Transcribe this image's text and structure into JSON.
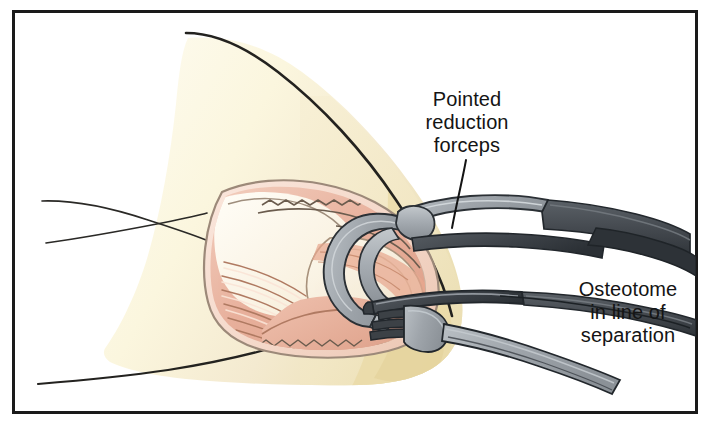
{
  "figure": {
    "type": "medical-surgical-illustration",
    "frame": {
      "border_color": "#1a1a1a",
      "border_width_px": 3,
      "background": "#ffffff",
      "inner_background": "#ffffff",
      "x": 12,
      "y": 10,
      "width": 686,
      "height": 404
    },
    "labels": [
      {
        "id": "forceps",
        "name": "pointed-reduction-forceps-label",
        "lines": [
          "Pointed",
          "reduction",
          "forceps"
        ],
        "align": "center",
        "leader": {
          "from_x": 466,
          "from_y": 162,
          "to_x": 452,
          "to_y": 228
        }
      },
      {
        "id": "osteotome",
        "name": "osteotome-label",
        "lines": [
          "Osteotome",
          "in line of",
          "separation"
        ],
        "align": "center",
        "leader": null
      }
    ],
    "colors": {
      "skin_light": "#fdfaec",
      "skin_mid": "#f7efcf",
      "skin_deep": "#efe3b0",
      "skin_shadow": "#e8d9a4",
      "dermis_pink": "#f6dcd0",
      "dermis_edge": "#a89585",
      "muscle_light": "#f0c8b6",
      "muscle_mid": "#e5ab97",
      "muscle_deep": "#d79682",
      "bone_cream": "#faf2e2",
      "bone_shade": "#efe2c8",
      "metal_light": "#aab0b6",
      "metal_mid": "#8c9298",
      "metal_dark": "#4c5258",
      "metal_darkest": "#32373c",
      "outline": "#1a1a1a",
      "text": "#141414"
    },
    "structures": [
      {
        "name": "skin-flap",
        "description": "large triangular skin flap, pale cream"
      },
      {
        "name": "wound-opening",
        "description": "retracted incision exposing deep tissue"
      },
      {
        "name": "subcutaneous-margin",
        "description": "pink dermal border of incision"
      },
      {
        "name": "muscle-belly",
        "description": "striated salmon muscle fibers"
      },
      {
        "name": "bone-surface",
        "description": "exposed cream bone at fracture"
      },
      {
        "name": "fascia-sheet",
        "description": "pale glistening fascial plane"
      }
    ],
    "instruments": [
      {
        "name": "pointed-reduction-forceps",
        "description": "curved pointed tip forceps grasping bone fragment",
        "finish": "light-gray-steel"
      },
      {
        "name": "osteotome",
        "description": "flat straight osteotome blade in line of separation",
        "finish": "dark-gray-steel"
      },
      {
        "name": "forked-retractor",
        "description": "notched fork-tipped instrument below osteotome",
        "finish": "gray-steel"
      }
    ],
    "guide_lines": [
      {
        "name": "limb-outline-upper",
        "description": "thin curved line to the left of flap"
      },
      {
        "name": "limb-outline-lower",
        "description": "thin straight line crossing upper line"
      },
      {
        "name": "limb-outline-bottom",
        "description": "long shallow curve along bottom"
      }
    ]
  }
}
